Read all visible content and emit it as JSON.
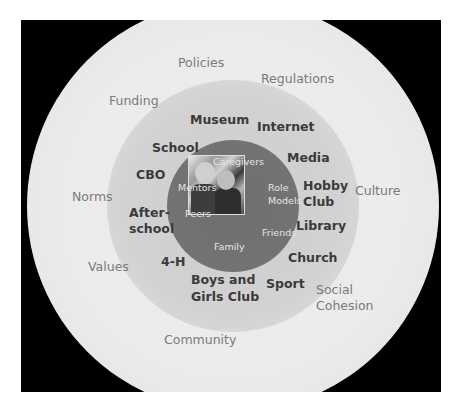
{
  "diagram": {
    "type": "concentric-circles",
    "colors": {
      "background": "#000000",
      "outer_ring": "#eaeaea",
      "middle_ring": "#d0d0d0",
      "inner_circle": "#707070",
      "outer_text": "#7a7a7a",
      "middle_text": "#3a3a3a",
      "inner_text": "#e6e6e6"
    },
    "center_image": "photo-children",
    "outer_ring": {
      "labels": [
        "Policies",
        "Regulations",
        "Funding",
        "Norms",
        "Culture",
        "Values",
        "Social",
        "Cohesion",
        "Community"
      ]
    },
    "middle_ring": {
      "labels": [
        "Museum",
        "Internet",
        "School",
        "Media",
        "CBO",
        "Hobby",
        "Club",
        "After-",
        "school",
        "Library",
        "Church",
        "4-H",
        "Boys and",
        "Girls Club",
        "Sport"
      ]
    },
    "inner_circle": {
      "labels": [
        "Caregivers",
        "Mentors",
        "Role",
        "Models",
        "Peers",
        "Friends",
        "Family"
      ]
    }
  }
}
